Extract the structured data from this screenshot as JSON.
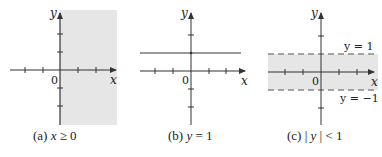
{
  "figure": {
    "panels": [
      {
        "id": "a",
        "caption_prefix": "(a)",
        "caption_expr": "x ≥ 0",
        "caption_var": "x",
        "caption_rest": " ≥ 0",
        "region": "x >= 0 shaded",
        "x_label": "x",
        "y_label": "y",
        "origin_label": "0",
        "shade_color": "#e6e6e6"
      },
      {
        "id": "b",
        "caption_prefix": "(b)",
        "caption_expr": "y = 1",
        "caption_var": "y",
        "caption_rest": " = 1",
        "region": "horizontal line y = 1",
        "x_label": "x",
        "y_label": "y",
        "origin_label": "0",
        "line_color": "#777777"
      },
      {
        "id": "c",
        "caption_prefix": "(c)",
        "caption_expr": "| y | < 1",
        "caption_var": "y",
        "caption_rest": " < 1",
        "region": "-1 < y < 1 shaded, dashed boundaries",
        "x_label": "x",
        "y_label": "y",
        "origin_label": "0",
        "upper_boundary_label": "y = 1",
        "lower_boundary_label": "y = −1",
        "shade_color": "#e6e6e6",
        "dash_color": "#888888"
      }
    ],
    "axis_color": "#333333"
  }
}
